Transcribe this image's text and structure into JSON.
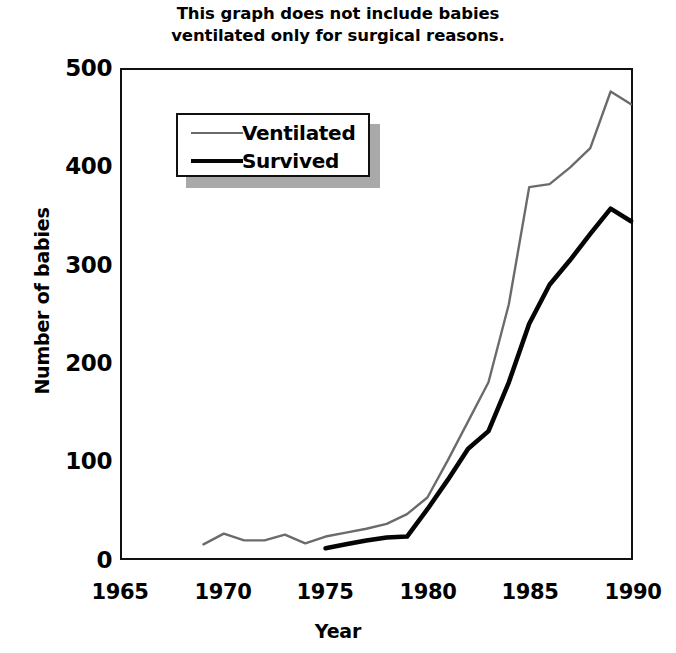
{
  "chart_data": {
    "type": "line",
    "title": "This graph does not include babies ventilated only for surgical reasons.",
    "title_lines": [
      "This graph does not include babies",
      "ventilated only for surgical reasons."
    ],
    "xlabel": "Year",
    "ylabel": "Number of babies",
    "xlim": [
      1965,
      1990
    ],
    "ylim": [
      0,
      500
    ],
    "xticks": [
      "1965",
      "1970",
      "1975",
      "1980",
      "1985",
      "1990"
    ],
    "yticks": [
      "0",
      "100",
      "200",
      "300",
      "400",
      "500"
    ],
    "grid": false,
    "legend_position": "upper-left-inside",
    "series": [
      {
        "name": "Ventilated",
        "color": "#6b6b6b",
        "line_width": 2.4,
        "x": [
          1969,
          1970,
          1971,
          1972,
          1973,
          1974,
          1975,
          1976,
          1977,
          1978,
          1979,
          1980,
          1981,
          1982,
          1983,
          1984,
          1985,
          1986,
          1987,
          1988,
          1989,
          1990
        ],
        "values": [
          14,
          25,
          18,
          18,
          24,
          15,
          22,
          26,
          30,
          35,
          45,
          62,
          100,
          140,
          180,
          260,
          380,
          383,
          400,
          420,
          478,
          465
        ]
      },
      {
        "name": "Survived",
        "color": "#050505",
        "line_width": 4.6,
        "x": [
          1975,
          1976,
          1977,
          1978,
          1979,
          1980,
          1981,
          1982,
          1983,
          1984,
          1985,
          1986,
          1987,
          1988,
          1989,
          1990
        ],
        "values": [
          10,
          14,
          18,
          21,
          22,
          50,
          80,
          112,
          130,
          180,
          240,
          280,
          305,
          332,
          358,
          345
        ]
      }
    ]
  },
  "legend": {
    "items": [
      {
        "label": "Ventilated"
      },
      {
        "label": "Survived"
      }
    ]
  }
}
